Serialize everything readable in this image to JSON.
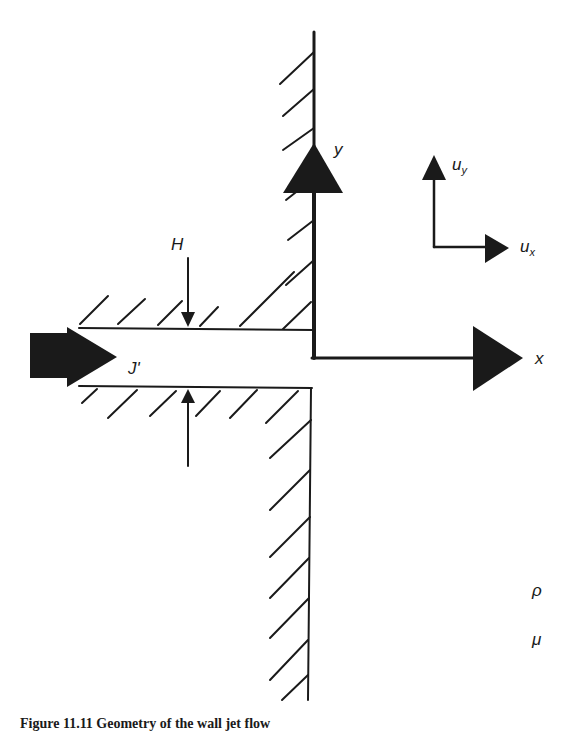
{
  "figure": {
    "caption": "Figure 11.11  Geometry of the wall jet flow"
  },
  "labels": {
    "y_axis": "y",
    "x_axis": "x",
    "uy_main": "u",
    "uy_sub": "y",
    "ux_main": "u",
    "ux_sub": "x",
    "H": "H",
    "J": "J'",
    "rho": "ρ",
    "mu": "μ"
  },
  "colors": {
    "ink": "#1a1a1a",
    "background": "#ffffff"
  }
}
